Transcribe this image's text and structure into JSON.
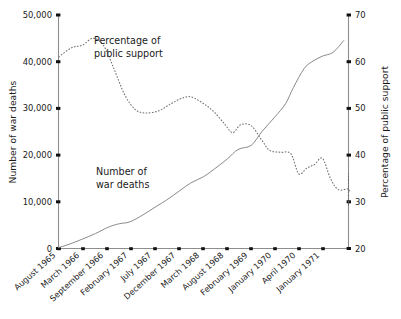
{
  "chart_data": {
    "type": "line",
    "title": "",
    "subtitle": "",
    "grid": false,
    "legend_position": "inline-annotations",
    "x": [
      "August 1965",
      "March 1966",
      "September 1966",
      "February 1967",
      "July 1967",
      "December 1967",
      "March 1968",
      "August 1968",
      "February 1969",
      "January 1970",
      "April 1970",
      "January 1971"
    ],
    "xlabel": "",
    "xtick_labels": [
      "August 1965",
      "March 1966",
      "September 1966",
      "February 1967",
      "July 1967",
      "December 1967",
      "March 1968",
      "August 1968",
      "February 1969",
      "January 1970",
      "April 1970",
      "January 1971"
    ],
    "axes": [
      {
        "id": "left",
        "ylabel": "Number of war deaths",
        "ylim": [
          0,
          50000
        ],
        "ytick_labels": [
          "0",
          "10,000",
          "20,000",
          "30,000",
          "40,000",
          "50,000"
        ],
        "ytick_values": [
          0,
          10000,
          20000,
          30000,
          40000,
          50000
        ]
      },
      {
        "id": "right",
        "ylabel": "Percentage of public support",
        "ylim": [
          20,
          70
        ],
        "ytick_labels": [
          "20",
          "30",
          "40",
          "50",
          "60",
          "70"
        ],
        "ytick_values": [
          20,
          30,
          40,
          50,
          60,
          70
        ]
      }
    ],
    "series": [
      {
        "name": "Number of war deaths",
        "axis": "left",
        "style": "solid",
        "annotation": "Number of\nwar deaths",
        "annotation_line1": "Number of",
        "annotation_line2": "war deaths",
        "points": [
          {
            "t": 0.0,
            "value": 200
          },
          {
            "t": 0.04,
            "value": 900
          },
          {
            "t": 0.09,
            "value": 2000
          },
          {
            "t": 0.14,
            "value": 3200
          },
          {
            "t": 0.19,
            "value": 4600
          },
          {
            "t": 0.23,
            "value": 5300
          },
          {
            "t": 0.27,
            "value": 5700
          },
          {
            "t": 0.32,
            "value": 7200
          },
          {
            "t": 0.37,
            "value": 9000
          },
          {
            "t": 0.41,
            "value": 10400
          },
          {
            "t": 0.46,
            "value": 12400
          },
          {
            "t": 0.5,
            "value": 14000
          },
          {
            "t": 0.55,
            "value": 15400
          },
          {
            "t": 0.59,
            "value": 17000
          },
          {
            "t": 0.64,
            "value": 19200
          },
          {
            "t": 0.68,
            "value": 21200
          },
          {
            "t": 0.73,
            "value": 22100
          },
          {
            "t": 0.77,
            "value": 25000
          },
          {
            "t": 0.82,
            "value": 28200
          },
          {
            "t": 0.86,
            "value": 31000
          },
          {
            "t": 0.89,
            "value": 34500
          },
          {
            "t": 0.93,
            "value": 38500
          },
          {
            "t": 0.96,
            "value": 40000
          },
          {
            "t": 1.0,
            "value": 41200
          },
          {
            "t": 1.04,
            "value": 42000
          },
          {
            "t": 1.08,
            "value": 44500
          }
        ],
        "values_at_ticks": [
          200,
          3200,
          5700,
          9000,
          12400,
          15400,
          19200,
          22100,
          28200,
          34500,
          40000,
          44500
        ],
        "final_value": 44500
      },
      {
        "name": "Percentage of public support",
        "axis": "right",
        "style": "dotted",
        "annotation": "Percentage of\npublic support",
        "annotation_line1": "Percentage of",
        "annotation_line2": "public support",
        "points": [
          {
            "t": 0.0,
            "value": 61.0
          },
          {
            "t": 0.05,
            "value": 63.0
          },
          {
            "t": 0.09,
            "value": 63.5
          },
          {
            "t": 0.13,
            "value": 65.0
          },
          {
            "t": 0.17,
            "value": 63.5
          },
          {
            "t": 0.21,
            "value": 58.5
          },
          {
            "t": 0.25,
            "value": 53.0
          },
          {
            "t": 0.29,
            "value": 49.8
          },
          {
            "t": 0.33,
            "value": 49.0
          },
          {
            "t": 0.38,
            "value": 49.5
          },
          {
            "t": 0.42,
            "value": 50.8
          },
          {
            "t": 0.46,
            "value": 52.0
          },
          {
            "t": 0.5,
            "value": 52.5
          },
          {
            "t": 0.55,
            "value": 51.0
          },
          {
            "t": 0.59,
            "value": 49.2
          },
          {
            "t": 0.63,
            "value": 46.6
          },
          {
            "t": 0.66,
            "value": 44.8
          },
          {
            "t": 0.69,
            "value": 46.5
          },
          {
            "t": 0.73,
            "value": 46.3
          },
          {
            "t": 0.77,
            "value": 43.2
          },
          {
            "t": 0.8,
            "value": 41.0
          },
          {
            "t": 0.84,
            "value": 40.6
          },
          {
            "t": 0.88,
            "value": 40.3
          },
          {
            "t": 0.91,
            "value": 36.0
          },
          {
            "t": 0.94,
            "value": 37.2
          },
          {
            "t": 0.97,
            "value": 38.0
          },
          {
            "t": 1.0,
            "value": 39.3
          },
          {
            "t": 1.03,
            "value": 35.0
          },
          {
            "t": 1.06,
            "value": 32.6
          },
          {
            "t": 1.1,
            "value": 32.8
          },
          {
            "t": 1.14,
            "value": 32.2
          },
          {
            "t": 1.17,
            "value": 34.2
          },
          {
            "t": 1.21,
            "value": 35.8
          },
          {
            "t": 1.25,
            "value": 35.4
          },
          {
            "t": 1.29,
            "value": 31.5
          },
          {
            "t": 1.33,
            "value": 29.0
          }
        ],
        "values_at_ticks": [
          61.0,
          63.5,
          49.8,
          52.0,
          49.2,
          46.3,
          40.6,
          37.2,
          32.6,
          34.2,
          35.4,
          29.0
        ],
        "final_value": 29.0
      }
    ],
    "colors": {
      "background": "#ffffff",
      "axis": "#8d8d8d",
      "tick": "#111111",
      "solid_series": "#8a8a8a",
      "dotted_series": "#6d6d6d",
      "text": "#1a1a1a"
    }
  }
}
